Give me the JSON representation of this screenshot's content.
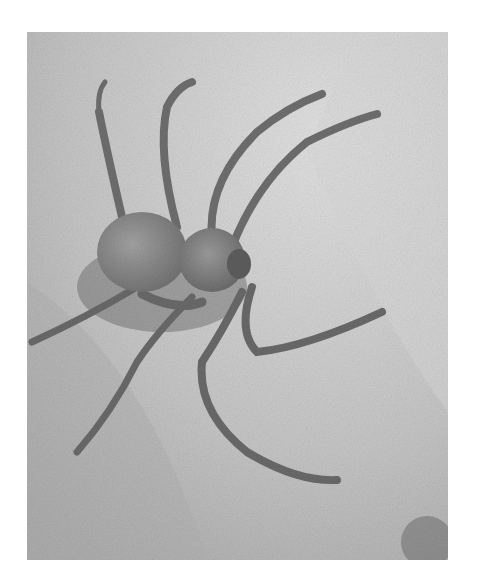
{
  "image": {
    "subject": "spider on sand",
    "description": "Grayscale photograph of a six-eyed sand spider resting on sand",
    "colors": {
      "page_background": "#ffffff",
      "sand_light": "#d6d6d6",
      "sand_mid": "#b8b8b8",
      "spider_body": "#8a8a8a",
      "spider_shadow": "#4a4a4a"
    }
  }
}
